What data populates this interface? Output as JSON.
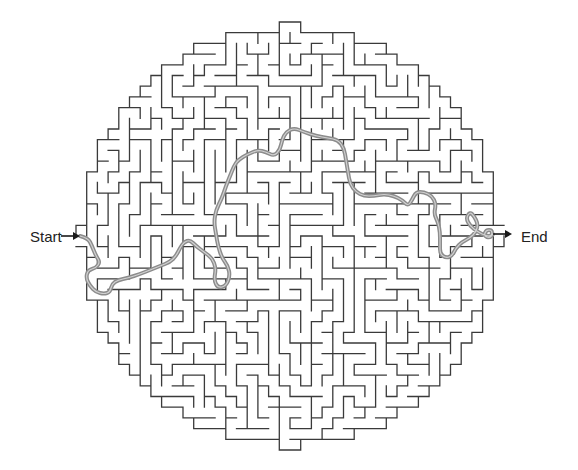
{
  "puzzle": {
    "type": "circular-maze",
    "start_label": "Start",
    "end_label": "End",
    "colors": {
      "background": "#ffffff",
      "wall": "#3a3a3a",
      "solution_path": "#8c8c8c",
      "solution_path_inner": "#ffffff",
      "arrow": "#1a1a1a",
      "label": "#222222"
    },
    "geometry": {
      "center_x": 290,
      "center_y": 236,
      "radius": 213,
      "cell_size": 10.7,
      "columns": 40,
      "rows": 40
    },
    "start_arrow": {
      "x1": 61,
      "y1": 236,
      "x2": 80,
      "y2": 236
    },
    "end_arrow": {
      "x1": 493,
      "y1": 234,
      "x2": 512,
      "y2": 234
    },
    "solution_path_points": [
      [
        80,
        236
      ],
      [
        88,
        238
      ],
      [
        92,
        246
      ],
      [
        96,
        256
      ],
      [
        100,
        262
      ],
      [
        96,
        268
      ],
      [
        88,
        270
      ],
      [
        86,
        278
      ],
      [
        90,
        286
      ],
      [
        96,
        292
      ],
      [
        104,
        294
      ],
      [
        110,
        292
      ],
      [
        112,
        284
      ],
      [
        118,
        280
      ],
      [
        128,
        278
      ],
      [
        140,
        274
      ],
      [
        150,
        270
      ],
      [
        160,
        266
      ],
      [
        170,
        262
      ],
      [
        176,
        256
      ],
      [
        180,
        248
      ],
      [
        184,
        242
      ],
      [
        190,
        240
      ],
      [
        196,
        246
      ],
      [
        204,
        252
      ],
      [
        212,
        258
      ],
      [
        216,
        268
      ],
      [
        214,
        280
      ],
      [
        218,
        288
      ],
      [
        226,
        286
      ],
      [
        230,
        276
      ],
      [
        228,
        266
      ],
      [
        222,
        258
      ],
      [
        218,
        246
      ],
      [
        216,
        234
      ],
      [
        214,
        222
      ],
      [
        216,
        210
      ],
      [
        222,
        198
      ],
      [
        226,
        186
      ],
      [
        230,
        176
      ],
      [
        234,
        166
      ],
      [
        238,
        160
      ],
      [
        248,
        154
      ],
      [
        258,
        150
      ],
      [
        266,
        152
      ],
      [
        274,
        156
      ],
      [
        280,
        150
      ],
      [
        282,
        140
      ],
      [
        286,
        132
      ],
      [
        294,
        128
      ],
      [
        304,
        132
      ],
      [
        316,
        136
      ],
      [
        328,
        138
      ],
      [
        338,
        140
      ],
      [
        344,
        148
      ],
      [
        346,
        160
      ],
      [
        348,
        172
      ],
      [
        350,
        184
      ],
      [
        356,
        192
      ],
      [
        364,
        196
      ],
      [
        374,
        196
      ],
      [
        384,
        194
      ],
      [
        394,
        196
      ],
      [
        402,
        200
      ],
      [
        408,
        206
      ],
      [
        412,
        200
      ],
      [
        416,
        192
      ],
      [
        424,
        192
      ],
      [
        432,
        196
      ],
      [
        436,
        204
      ],
      [
        434,
        214
      ],
      [
        438,
        222
      ],
      [
        440,
        232
      ],
      [
        440,
        244
      ],
      [
        440,
        254
      ],
      [
        446,
        258
      ],
      [
        452,
        256
      ],
      [
        456,
        248
      ],
      [
        462,
        242
      ],
      [
        470,
        238
      ],
      [
        476,
        232
      ],
      [
        478,
        224
      ],
      [
        474,
        216
      ],
      [
        470,
        212
      ],
      [
        466,
        218
      ],
      [
        470,
        226
      ],
      [
        478,
        232
      ],
      [
        486,
        236
      ],
      [
        492,
        236
      ],
      [
        492,
        230
      ],
      [
        486,
        230
      ],
      [
        484,
        236
      ],
      [
        490,
        238
      ],
      [
        493,
        234
      ]
    ]
  }
}
